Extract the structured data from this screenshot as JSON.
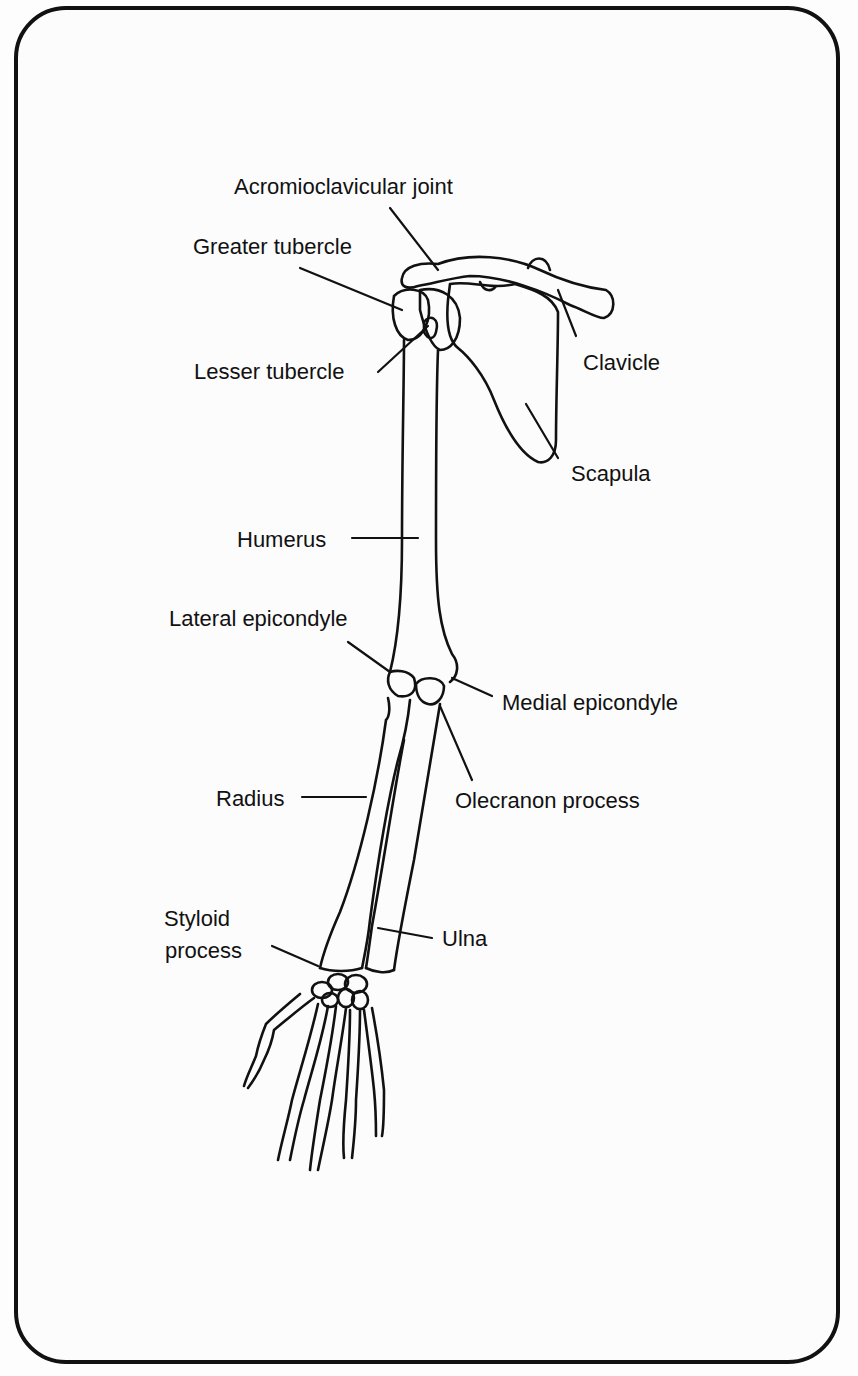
{
  "diagram": {
    "labels": [
      {
        "id": "acromioclavicular-joint",
        "text": "Acromioclavicular joint"
      },
      {
        "id": "greater-tubercle",
        "text": "Greater tubercle"
      },
      {
        "id": "lesser-tubercle",
        "text": "Lesser tubercle"
      },
      {
        "id": "clavicle",
        "text": "Clavicle"
      },
      {
        "id": "scapula",
        "text": "Scapula"
      },
      {
        "id": "humerus",
        "text": "Humerus"
      },
      {
        "id": "lateral-epicondyle",
        "text": "Lateral epicondyle"
      },
      {
        "id": "medial-epicondyle",
        "text": "Medial epicondyle"
      },
      {
        "id": "radius",
        "text": "Radius"
      },
      {
        "id": "olecranon-process",
        "text": "Olecranon process"
      },
      {
        "id": "styloid-process-line1",
        "text": "Styloid"
      },
      {
        "id": "styloid-process-line2",
        "text": "process"
      },
      {
        "id": "ulna",
        "text": "Ulna"
      }
    ],
    "colors": {
      "ink": "#111111",
      "paper": "#fcfcfc"
    }
  }
}
